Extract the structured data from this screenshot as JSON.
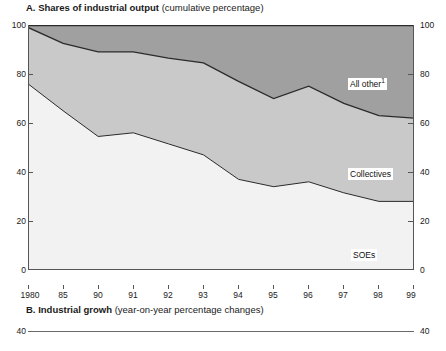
{
  "panel_a": {
    "letter": "A.",
    "title_main": "Shares of industrial output",
    "title_sub": "(cumulative percentage)",
    "labels": {
      "all_other": "All other",
      "all_other_footnote": "1",
      "collectives": "Collectives",
      "soes": "SOEs"
    }
  },
  "panel_b": {
    "letter": "B.",
    "title_main": "Industrial growh",
    "title_sub": "(year-on-year percentage changes)",
    "y_top_left": "40",
    "y_top_right": "40"
  },
  "colors": {
    "soes_fill": "#f2f2f2",
    "collectives_fill": "#c9c9c9",
    "all_other_fill": "#a0a0a0",
    "line": "#2b2b2b",
    "axis": "#555555",
    "text": "#1a1a1a"
  },
  "chart_data": {
    "type": "area",
    "title": "A. Shares of industrial output (cumulative percentage)",
    "subtitle": "(cumulative percentage)",
    "xlabel": "",
    "ylabel": "",
    "ylim": [
      0,
      100
    ],
    "yticks": [
      0,
      20,
      40,
      60,
      80,
      100
    ],
    "ytick_labels_left": [
      "0",
      "20",
      "40",
      "60",
      "80",
      "100"
    ],
    "ytick_labels_right": [
      "0",
      "20",
      "40",
      "60",
      "80",
      "100"
    ],
    "grid": false,
    "legend": "in-plot labels",
    "stacked": true,
    "categories": [
      "1980",
      "85",
      "90",
      "91",
      "92",
      "93",
      "94",
      "95",
      "96",
      "97",
      "98",
      "99"
    ],
    "x": [
      1980,
      1985,
      1990,
      1991,
      1992,
      1993,
      1994,
      1995,
      1996,
      1997,
      1998,
      1999
    ],
    "series": [
      {
        "name": "SOEs",
        "values": [
          76,
          65,
          54.5,
          56,
          51.5,
          47,
          37,
          34,
          36,
          31.5,
          28,
          28
        ],
        "cumulative_top": [
          76,
          65,
          54.5,
          56,
          51.5,
          47,
          37,
          34,
          36,
          31.5,
          28,
          28
        ]
      },
      {
        "name": "Collectives",
        "values": [
          23,
          27.5,
          34.5,
          33,
          35,
          37.5,
          40,
          36,
          39,
          36.5,
          35,
          34
        ],
        "cumulative_top": [
          99,
          92.5,
          89,
          89,
          86.5,
          84.5,
          77,
          70,
          75,
          68,
          63,
          62
        ]
      },
      {
        "name": "All other",
        "values": [
          1,
          7.5,
          11,
          11,
          13.5,
          15.5,
          23,
          30,
          25,
          32,
          37,
          38
        ],
        "cumulative_top": [
          100,
          100,
          100,
          100,
          100,
          100,
          100,
          100,
          100,
          100,
          100,
          100
        ]
      }
    ],
    "annotations": [
      {
        "text": "All other1",
        "series": "All other"
      },
      {
        "text": "Collectives",
        "series": "Collectives"
      },
      {
        "text": "SOEs",
        "series": "SOEs"
      }
    ]
  },
  "chart_b": {
    "type": "line",
    "title": "B. Industrial growh (year-on-year percentage changes)",
    "ylim_top": 40,
    "visible_yticks": [
      "40"
    ]
  }
}
